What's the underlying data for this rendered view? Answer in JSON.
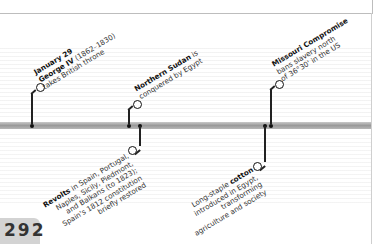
{
  "page": {
    "number": "292"
  },
  "events_above": [
    {
      "title": "January 29",
      "lines": [
        "George IV (1862–1830)",
        "takes British throne"
      ],
      "title_bold": true,
      "subtitle_bold_prefix": "George IV"
    },
    {
      "title": "Northern Sudan",
      "lines": [
        "is",
        "conquered by Egypt"
      ]
    },
    {
      "title": "Missouri Compromise",
      "lines": [
        "bans slavery north",
        "of 36°30' in the US"
      ]
    }
  ],
  "events_below": [
    {
      "title": "Revolts",
      "lines": [
        "in Spain, Portugal,",
        "Naples, Sicily, Piedmont,",
        "and Balkans (to 1823);",
        "Spain's 1812 constitution",
        "briefly restored"
      ]
    },
    {
      "title": "cotton",
      "lines": [
        "Long-staple",
        "introduced in Egypt,",
        "transforming",
        "agriculture and society"
      ]
    }
  ]
}
